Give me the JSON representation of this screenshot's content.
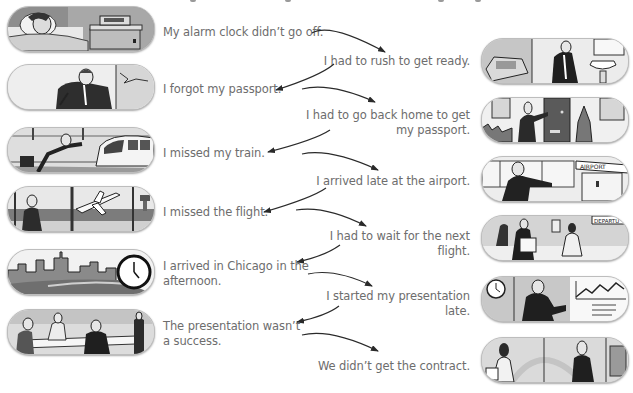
{
  "exercise": {
    "title_partially_visible": true,
    "left_column": [
      {
        "id": "alarm",
        "lines": [
          "My alarm clock didn’t go off."
        ],
        "illustration": "man-sleeping-alarm-clock-illustration"
      },
      {
        "id": "passport",
        "lines": [
          "I forgot my passport."
        ],
        "illustration": "man-panicking-illustration"
      },
      {
        "id": "train",
        "lines": [
          "I missed my train."
        ],
        "illustration": "man-running-after-train-illustration"
      },
      {
        "id": "flight",
        "lines": [
          "I missed the flight."
        ],
        "illustration": "airplane-taking-off-illustration"
      },
      {
        "id": "chicago",
        "lines": [
          "I arrived in Chicago in the",
          "afternoon."
        ],
        "illustration": "city-skyline-clock-illustration"
      },
      {
        "id": "success",
        "lines": [
          "The presentation wasn’t",
          "a success."
        ],
        "illustration": "meeting-table-illustration"
      }
    ],
    "right_column": [
      {
        "id": "rush",
        "lines": [
          "I had to rush to get ready."
        ],
        "illustration": "man-brushing-teeth-illustration"
      },
      {
        "id": "goback",
        "lines": [
          "I had to go back home to get",
          "my passport."
        ],
        "illustration": "man-at-front-door-illustration"
      },
      {
        "id": "late",
        "lines": [
          "I arrived late at the airport."
        ],
        "illustration": "man-at-airport-entrance-illustration"
      },
      {
        "id": "wait",
        "lines": [
          "I had to wait for the next",
          "flight."
        ],
        "illustration": "departure-lounge-illustration"
      },
      {
        "id": "started",
        "lines": [
          "I started my presentation",
          "late."
        ],
        "illustration": "man-presenting-chart-illustration"
      },
      {
        "id": "contract",
        "lines": [
          "We didn’t get the contract."
        ],
        "illustration": "office-people-leaving-illustration"
      }
    ],
    "colors": {
      "text": "#6d6d6d",
      "arrow": "#2a2a2a",
      "pill_border": "#bdbdbd",
      "background": "#ffffff"
    }
  }
}
